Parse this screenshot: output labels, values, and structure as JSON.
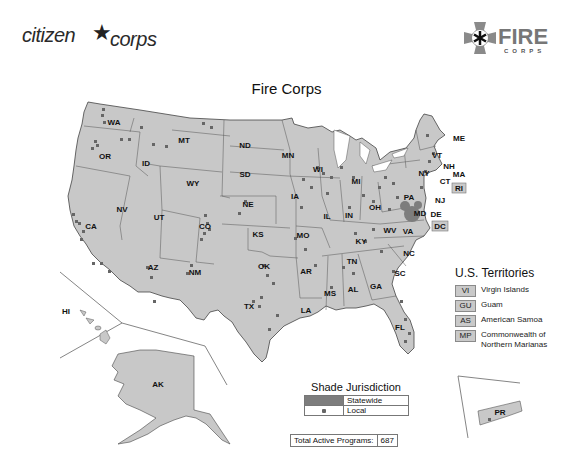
{
  "header": {
    "left_logo": {
      "word1": "citizen",
      "star": "★",
      "word2": "corps"
    },
    "right_logo": {
      "word1": "FIRE",
      "word2": "CORPS"
    }
  },
  "map": {
    "title": "Fire Corps",
    "fill_color": "#c8c8c8",
    "border_color": "#555555",
    "dot_color": "#666666",
    "statewide_color": "#7d7d7d",
    "state_labels": [
      "WA",
      "OR",
      "CA",
      "ID",
      "NV",
      "MT",
      "WY",
      "UT",
      "AZ",
      "CO",
      "NM",
      "ND",
      "SD",
      "NE",
      "KS",
      "OK",
      "TX",
      "MN",
      "IA",
      "MO",
      "AR",
      "LA",
      "WI",
      "IL",
      "MS",
      "MI",
      "IN",
      "KY",
      "TN",
      "AL",
      "OH",
      "GA",
      "FL",
      "SC",
      "NC",
      "WV",
      "VA",
      "PA",
      "NY",
      "VT",
      "NH",
      "ME",
      "MA",
      "CT",
      "RI",
      "NJ",
      "DE",
      "MD",
      "DC",
      "AK",
      "HI",
      "PR"
    ]
  },
  "territories": {
    "title": "U.S. Territories",
    "items": [
      {
        "code": "VI",
        "name": "Virgin Islands"
      },
      {
        "code": "GU",
        "name": "Guam"
      },
      {
        "code": "AS",
        "name": "American Samoa"
      },
      {
        "code": "MP",
        "name": "Commonwealth of Northern Marianas"
      }
    ]
  },
  "legend": {
    "title": "Shade Jurisdiction",
    "items": [
      {
        "label": "Statewide"
      },
      {
        "label": "Local"
      }
    ]
  },
  "totals": {
    "label": "Total Active Programs:",
    "value": "687"
  }
}
